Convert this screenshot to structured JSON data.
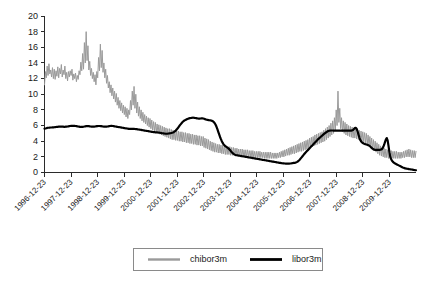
{
  "chart_data": {
    "type": "line",
    "title": "",
    "subtitle": "",
    "xlabel": "",
    "ylabel": "",
    "ylim": [
      0,
      20
    ],
    "ytick_values": [
      0,
      2,
      4,
      6,
      8,
      10,
      12,
      14,
      16,
      18,
      20
    ],
    "ytick_labels": [
      "0",
      "2",
      "4",
      "6",
      "8",
      "10",
      "12",
      "14",
      "16",
      "18",
      "20"
    ],
    "grid": false,
    "legend_position": "bottom-center",
    "xtick_labels": [
      "1996-12-23",
      "1997-12-23",
      "1998-12-23",
      "1999-12-23",
      "2000-12-23",
      "2001-12-23",
      "2002-12-23",
      "2003-12-23",
      "2004-12-23",
      "2005-12-23",
      "2006-12-23",
      "2007-12-23",
      "2008-12-23",
      "2009-12-23"
    ],
    "xtick_rotation_deg": 45,
    "x_start_label": "1996-12-23",
    "x_end_label": "2010-06-23",
    "colors": {
      "chibor3m": "#9a9a9a",
      "libor3m": "#000000",
      "axis": "#2b2b2b",
      "background": "#ffffff"
    },
    "series": [
      {
        "name": "chibor3m",
        "color": "#9a9a9a",
        "linewidth": 1,
        "values": [
          11.2,
          12.9,
          12.1,
          13.6,
          12.4,
          13.9,
          12.6,
          13.1,
          12.2,
          13.4,
          12.0,
          13.2,
          11.9,
          13.0,
          12.3,
          13.5,
          12.1,
          13.3,
          12.6,
          13.8,
          12.2,
          13.1,
          12.5,
          13.6,
          12.0,
          12.8,
          11.7,
          12.9,
          12.2,
          13.0,
          12.4,
          13.2,
          11.8,
          12.6,
          12.0,
          12.7,
          11.6,
          12.4,
          11.9,
          13.0,
          12.5,
          14.1,
          13.0,
          15.2,
          13.2,
          16.6,
          14.0,
          18.0,
          14.3,
          16.2,
          13.1,
          14.2,
          12.4,
          13.3,
          12.0,
          12.8,
          11.6,
          12.5,
          11.2,
          12.9,
          12.1,
          14.7,
          13.0,
          16.4,
          13.4,
          15.6,
          12.8,
          14.0,
          12.1,
          13.2,
          11.4,
          12.4,
          10.8,
          11.6,
          10.2,
          11.2,
          9.8,
          10.8,
          9.4,
          10.4,
          9.0,
          10.1,
          8.6,
          9.6,
          8.2,
          9.2,
          7.9,
          8.9,
          7.6,
          8.6,
          7.4,
          8.4,
          7.1,
          8.2,
          6.9,
          8.0,
          7.4,
          9.2,
          8.0,
          10.4,
          8.6,
          11.0,
          8.2,
          10.0,
          7.6,
          9.0,
          7.2,
          8.4,
          6.9,
          8.0,
          6.6,
          7.7,
          6.4,
          7.4,
          6.2,
          7.2,
          6.0,
          7.0,
          5.8,
          6.9,
          5.6,
          6.7,
          5.4,
          6.5,
          5.3,
          6.4,
          5.1,
          6.2,
          5.0,
          6.1,
          4.9,
          6.0,
          4.8,
          5.9,
          4.7,
          5.8,
          4.6,
          5.7,
          4.5,
          5.6,
          4.4,
          5.6,
          4.3,
          5.5,
          4.2,
          5.4,
          4.2,
          5.4,
          4.1,
          5.3,
          4.1,
          5.3,
          4.0,
          5.2,
          4.0,
          5.2,
          3.9,
          5.1,
          3.9,
          5.1,
          3.8,
          5.0,
          3.8,
          5.0,
          3.7,
          4.9,
          3.7,
          4.9,
          3.6,
          4.8,
          3.6,
          4.8,
          3.5,
          4.7,
          3.5,
          4.7,
          3.4,
          4.6,
          3.4,
          4.6,
          3.2,
          4.4,
          3.1,
          4.3,
          3.0,
          4.2,
          2.9,
          4.0,
          2.8,
          3.9,
          2.7,
          3.8,
          2.6,
          3.7,
          2.6,
          3.6,
          2.5,
          3.6,
          2.5,
          3.5,
          2.4,
          3.5,
          2.4,
          3.4,
          2.3,
          3.4,
          2.3,
          3.3,
          2.3,
          3.3,
          2.2,
          3.2,
          2.2,
          3.2,
          2.2,
          3.1,
          2.1,
          3.1,
          2.1,
          3.0,
          2.1,
          3.0,
          2.1,
          3.0,
          2.0,
          2.9,
          2.0,
          2.9,
          2.0,
          2.9,
          2.0,
          2.8,
          2.0,
          2.8,
          1.9,
          2.8,
          1.9,
          2.7,
          1.9,
          2.7,
          1.9,
          2.7,
          1.9,
          2.7,
          1.9,
          2.6,
          1.9,
          2.6,
          1.8,
          2.6,
          1.8,
          2.6,
          1.8,
          2.6,
          1.8,
          2.6,
          1.8,
          2.5,
          1.8,
          2.5,
          1.8,
          2.5,
          1.8,
          2.5,
          1.9,
          2.6,
          1.9,
          2.7,
          2.0,
          2.8,
          2.0,
          2.9,
          2.1,
          3.0,
          2.2,
          3.1,
          2.2,
          3.2,
          2.3,
          3.3,
          2.4,
          3.4,
          2.4,
          3.5,
          2.5,
          3.6,
          2.6,
          3.7,
          2.7,
          3.8,
          2.7,
          3.9,
          2.8,
          4.0,
          2.9,
          4.1,
          3.0,
          4.2,
          3.1,
          4.4,
          3.2,
          4.5,
          3.3,
          4.6,
          3.4,
          4.8,
          3.5,
          4.9,
          3.6,
          5.0,
          3.7,
          5.1,
          3.8,
          5.2,
          3.9,
          5.4,
          4.0,
          5.6,
          4.2,
          5.8,
          4.4,
          6.0,
          4.6,
          6.3,
          4.8,
          6.6,
          5.0,
          7.0,
          5.4,
          8.0,
          6.0,
          10.4,
          6.4,
          8.2,
          5.6,
          7.0,
          5.2,
          6.6,
          5.0,
          6.4,
          4.8,
          6.2,
          4.7,
          6.0,
          4.6,
          5.9,
          4.5,
          5.8,
          4.4,
          5.7,
          4.4,
          5.6,
          4.3,
          5.5,
          4.2,
          5.4,
          4.1,
          5.3,
          4.0,
          5.2,
          3.9,
          5.1,
          3.8,
          5.0,
          3.6,
          4.8,
          3.4,
          4.6,
          3.2,
          4.4,
          3.0,
          4.2,
          2.8,
          4.0,
          2.6,
          3.8,
          2.4,
          3.6,
          2.2,
          3.4,
          2.1,
          3.2,
          2.0,
          3.1,
          1.9,
          3.0,
          1.9,
          2.9,
          1.8,
          2.8,
          1.8,
          2.8,
          1.8,
          2.7,
          1.8,
          2.7,
          1.8,
          2.7,
          1.8,
          2.6,
          1.8,
          2.6,
          1.8,
          2.6,
          1.9,
          2.7,
          1.9,
          2.8,
          2.0,
          2.9,
          2.0,
          3.0,
          2.0,
          2.9,
          1.9,
          2.8,
          1.9,
          2.8,
          1.9,
          2.7
        ]
      },
      {
        "name": "libor3m",
        "color": "#000000",
        "linewidth": 2.2,
        "values": [
          5.6,
          5.62,
          5.65,
          5.7,
          5.72,
          5.72,
          5.74,
          5.75,
          5.75,
          5.76,
          5.76,
          5.78,
          5.8,
          5.82,
          5.84,
          5.84,
          5.85,
          5.86,
          5.86,
          5.86,
          5.86,
          5.85,
          5.84,
          5.84,
          5.85,
          5.86,
          5.88,
          5.9,
          5.92,
          5.94,
          5.96,
          5.97,
          5.97,
          5.96,
          5.95,
          5.94,
          5.92,
          5.9,
          5.88,
          5.86,
          5.84,
          5.82,
          5.82,
          5.83,
          5.85,
          5.88,
          5.9,
          5.92,
          5.93,
          5.93,
          5.92,
          5.9,
          5.88,
          5.86,
          5.85,
          5.85,
          5.86,
          5.88,
          5.9,
          5.92,
          5.93,
          5.94,
          5.94,
          5.93,
          5.92,
          5.9,
          5.88,
          5.86,
          5.85,
          5.85,
          5.86,
          5.88,
          5.9,
          5.92,
          5.94,
          5.95,
          5.95,
          5.94,
          5.92,
          5.9,
          5.88,
          5.86,
          5.84,
          5.82,
          5.8,
          5.78,
          5.76,
          5.74,
          5.72,
          5.7,
          5.68,
          5.66,
          5.64,
          5.62,
          5.6,
          5.58,
          5.58,
          5.58,
          5.58,
          5.58,
          5.58,
          5.57,
          5.56,
          5.55,
          5.54,
          5.52,
          5.5,
          5.48,
          5.46,
          5.44,
          5.42,
          5.4,
          5.38,
          5.36,
          5.34,
          5.32,
          5.3,
          5.28,
          5.26,
          5.24,
          5.22,
          5.2,
          5.18,
          5.16,
          5.15,
          5.14,
          5.13,
          5.12,
          5.11,
          5.1,
          5.08,
          5.06,
          5.04,
          5.02,
          5.0,
          4.98,
          4.96,
          4.95,
          4.95,
          4.96,
          4.98,
          5.0,
          5.02,
          5.05,
          5.08,
          5.12,
          5.18,
          5.26,
          5.36,
          5.48,
          5.62,
          5.78,
          5.94,
          6.08,
          6.22,
          6.36,
          6.48,
          6.58,
          6.66,
          6.72,
          6.78,
          6.84,
          6.88,
          6.92,
          6.94,
          6.96,
          6.98,
          7.0,
          7.0,
          6.98,
          6.96,
          6.94,
          6.92,
          6.9,
          6.88,
          6.88,
          6.9,
          6.92,
          6.92,
          6.9,
          6.86,
          6.82,
          6.78,
          6.74,
          6.72,
          6.7,
          6.68,
          6.66,
          6.64,
          6.6,
          6.54,
          6.44,
          6.3,
          6.1,
          5.84,
          5.54,
          5.2,
          4.86,
          4.54,
          4.26,
          4.0,
          3.78,
          3.6,
          3.46,
          3.36,
          3.28,
          3.2,
          3.12,
          3.02,
          2.9,
          2.76,
          2.62,
          2.5,
          2.4,
          2.32,
          2.26,
          2.22,
          2.2,
          2.18,
          2.16,
          2.14,
          2.12,
          2.1,
          2.08,
          2.06,
          2.04,
          2.02,
          2.0,
          1.98,
          1.96,
          1.94,
          1.92,
          1.9,
          1.88,
          1.86,
          1.84,
          1.82,
          1.8,
          1.78,
          1.76,
          1.74,
          1.72,
          1.7,
          1.68,
          1.66,
          1.64,
          1.62,
          1.6,
          1.58,
          1.56,
          1.54,
          1.52,
          1.5,
          1.48,
          1.46,
          1.44,
          1.42,
          1.4,
          1.38,
          1.36,
          1.34,
          1.32,
          1.3,
          1.28,
          1.26,
          1.24,
          1.22,
          1.2,
          1.18,
          1.17,
          1.16,
          1.15,
          1.14,
          1.14,
          1.14,
          1.14,
          1.14,
          1.15,
          1.16,
          1.18,
          1.2,
          1.22,
          1.24,
          1.26,
          1.3,
          1.36,
          1.44,
          1.54,
          1.66,
          1.8,
          1.94,
          2.08,
          2.22,
          2.36,
          2.5,
          2.62,
          2.74,
          2.86,
          2.98,
          3.1,
          3.22,
          3.34,
          3.46,
          3.58,
          3.7,
          3.82,
          3.94,
          4.06,
          4.18,
          4.3,
          4.4,
          4.5,
          4.6,
          4.7,
          4.8,
          4.9,
          5.0,
          5.08,
          5.16,
          5.24,
          5.3,
          5.34,
          5.36,
          5.37,
          5.37,
          5.37,
          5.36,
          5.36,
          5.36,
          5.36,
          5.36,
          5.36,
          5.36,
          5.36,
          5.36,
          5.36,
          5.36,
          5.36,
          5.36,
          5.36,
          5.36,
          5.36,
          5.36,
          5.36,
          5.36,
          5.36,
          5.36,
          5.38,
          5.44,
          5.56,
          5.68,
          5.72,
          5.6,
          5.3,
          4.9,
          4.5,
          4.2,
          4.0,
          3.86,
          3.76,
          3.7,
          3.66,
          3.62,
          3.58,
          3.54,
          3.5,
          3.44,
          3.36,
          3.26,
          3.14,
          3.04,
          2.96,
          2.92,
          2.9,
          2.9,
          2.9,
          2.9,
          2.9,
          2.9,
          2.92,
          2.96,
          3.06,
          3.24,
          3.52,
          3.88,
          4.2,
          4.4,
          4.1,
          3.4,
          2.6,
          2.0,
          1.7,
          1.5,
          1.36,
          1.26,
          1.18,
          1.12,
          1.06,
          1.0,
          0.94,
          0.88,
          0.82,
          0.76,
          0.7,
          0.64,
          0.6,
          0.56,
          0.52,
          0.5,
          0.48,
          0.46,
          0.44,
          0.42,
          0.4,
          0.38,
          0.36,
          0.34,
          0.32,
          0.3,
          0.29
        ]
      }
    ]
  },
  "legend": {
    "entries": [
      {
        "label": "chibor3m",
        "color": "#9a9a9a"
      },
      {
        "label": "libor3m",
        "color": "#000000"
      }
    ],
    "chibor_label": "chibor3m",
    "libor_label": "libor3m"
  },
  "yticks": {
    "t0": "0",
    "t1": "2",
    "t2": "4",
    "t3": "6",
    "t4": "8",
    "t5": "10",
    "t6": "12",
    "t7": "14",
    "t8": "16",
    "t9": "18",
    "t10": "20"
  }
}
